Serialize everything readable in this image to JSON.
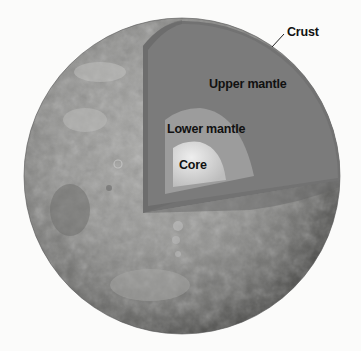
{
  "diagram": {
    "labels": {
      "crust": "Crust",
      "upper_mantle": "Upper mantle",
      "lower_mantle": "Lower mantle",
      "core": "Core"
    },
    "layers": [
      {
        "name": "Crust",
        "color": "#6f6f6f"
      },
      {
        "name": "Upper mantle",
        "color": "#7d7d7d"
      },
      {
        "name": "Lower mantle",
        "color": "#9a9a9a"
      },
      {
        "name": "Core",
        "color": "#c9c9c9"
      }
    ],
    "colors": {
      "background": "#fbfbfa",
      "surface": "#8e8e8e",
      "label_text": "#111111"
    }
  }
}
